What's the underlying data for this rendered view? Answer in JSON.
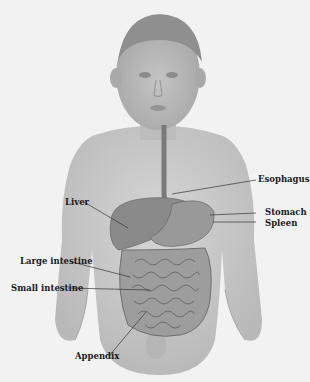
{
  "diagram": {
    "labels": [
      {
        "id": "esophagus",
        "text": "Esophagus"
      },
      {
        "id": "liver",
        "text": "Liver"
      },
      {
        "id": "stomach",
        "text": "Stomach"
      },
      {
        "id": "spleen",
        "text": "Spleen"
      },
      {
        "id": "large_intestine",
        "text": "Large intestine"
      },
      {
        "id": "small_intestine",
        "text": "Small intestine"
      },
      {
        "id": "appendix",
        "text": "Appendix"
      }
    ],
    "colors": {
      "background": "#f2f2f2",
      "skin": "#c8c8c8",
      "organ": "#8a8a8a",
      "leader_line": "#333333"
    }
  }
}
